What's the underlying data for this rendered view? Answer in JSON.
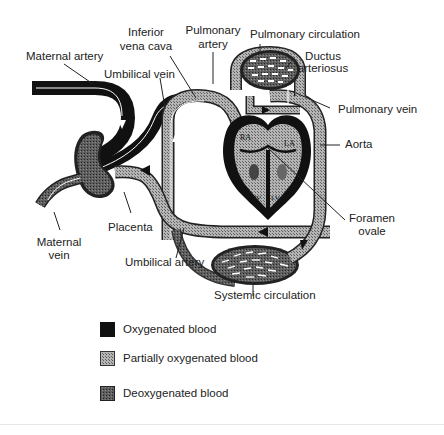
{
  "diagram": {
    "labels": {
      "maternal_artery": "Maternal artery",
      "inferior_vena_cava_line1": "Inferior",
      "inferior_vena_cava_line2": "vena cava",
      "pulmonary_artery_line1": "Pulmonary",
      "pulmonary_artery_line2": "artery",
      "pulmonary_circulation": "Pulmonary circulation",
      "ductus_arteriosus_line1": "Ductus",
      "ductus_arteriosus_line2": "arteriosus",
      "umbilical_vein": "Umbilical vein",
      "pulmonary_vein": "Pulmonary vein",
      "aorta": "Aorta",
      "foramen_ovale_line1": "Foramen",
      "foramen_ovale_line2": "ovale",
      "placenta": "Placenta",
      "maternal_vein_line1": "Maternal",
      "maternal_vein_line2": "vein",
      "umbilical_artery": "Umbilical artery",
      "systemic_circulation": "Systemic circulation"
    },
    "heart_chambers": {
      "ra": "RA",
      "la": "LA",
      "rv": "RV",
      "lv": "LV"
    }
  },
  "legend": {
    "items": [
      {
        "label": "Oxygenated blood",
        "pattern": "solid-black",
        "color": "#111111"
      },
      {
        "label": "Partially oxygenated blood",
        "pattern": "light-crosshatch",
        "color": "#9a9a9a"
      },
      {
        "label": "Deoxygenated blood",
        "pattern": "dark-crosshatch",
        "color": "#4a4a4a"
      }
    ]
  },
  "colors": {
    "oxygenated": "#111111",
    "partial": "#9a9a9a",
    "deoxygenated": "#4a4a4a",
    "line": "#222222",
    "background": "#ffffff"
  }
}
